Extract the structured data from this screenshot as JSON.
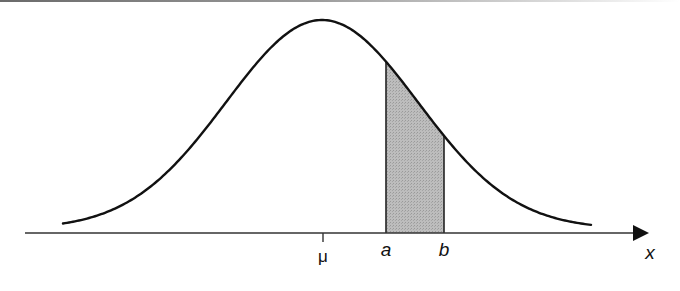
{
  "diagram": {
    "type": "normal-curve-shaded-area",
    "labels": {
      "mean": "μ",
      "lower_bound": "a",
      "upper_bound": "b",
      "axis": "x"
    },
    "curve": {
      "peak_x": 322,
      "peak_y": 20,
      "baseline_y": 233,
      "sigma_px": 96,
      "x_start": 63,
      "x_end": 592
    },
    "shaded_region": {
      "from": "a",
      "to": "b",
      "fill": "#b4b4b4"
    },
    "colors": {
      "stroke": "#111111",
      "axis": "#333333",
      "shade": "#b4b4b4"
    }
  }
}
